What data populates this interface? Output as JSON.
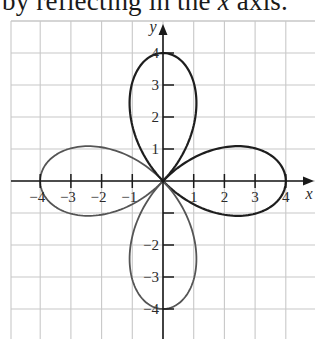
{
  "heading": {
    "prefix": "by reflecting in the ",
    "variable": "x",
    "suffix": " axis."
  },
  "chart_data": {
    "type": "line",
    "title": "",
    "curve": "r = 4cos(2θ) (four-leaved rose)",
    "xlabel": "x",
    "ylabel": "y",
    "xlim": [
      -5,
      5
    ],
    "ylim": [
      -5,
      5
    ],
    "grid": true,
    "x_ticks": [
      -4,
      -3,
      -2,
      -1,
      1,
      2,
      3,
      4
    ],
    "x_tick_labels": [
      "−4",
      "−3",
      "−2",
      "−1",
      "1",
      "2",
      "3",
      "4"
    ],
    "y_ticks": [
      -4,
      -3,
      -2,
      -1,
      1,
      2,
      3,
      4
    ],
    "y_tick_labels": [
      "−4",
      "−3",
      "−2",
      "",
      "1",
      "2",
      "3",
      "4"
    ],
    "petals": [
      {
        "direction": "right",
        "tip": [
          4,
          0
        ],
        "max_width": 1.1
      },
      {
        "direction": "up",
        "tip": [
          0,
          4
        ],
        "max_width": 1.1
      },
      {
        "direction": "left",
        "tip": [
          -4,
          0
        ],
        "max_width": 1.1
      },
      {
        "direction": "down",
        "tip": [
          0,
          -4
        ],
        "max_width": 1.1
      }
    ],
    "amplitude": 4,
    "k": 2
  },
  "layout": {
    "origin_px": [
      163,
      181
    ],
    "unit_x_px": 30.7,
    "unit_y_px": 32,
    "grid_top_px": 21,
    "grid_bottom_px": 339,
    "grid_left_px": 11,
    "grid_right_px": 315,
    "colors": {
      "grid": "#c8c8c8",
      "axis": "#1a1a1a",
      "curve_dark": "#1e1e1e",
      "curve_light": "#555555"
    }
  }
}
